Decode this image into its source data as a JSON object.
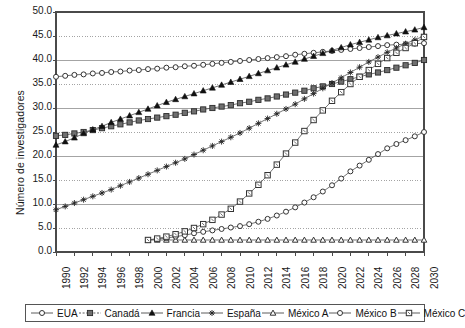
{
  "axes": {
    "ylabel": "Número de investigadores",
    "yticks": [
      "0.0",
      "5.0",
      "10.0",
      "15.0",
      "20.0",
      "25.0",
      "30.0",
      "35.0",
      "40.0",
      "45.0",
      "50.0"
    ],
    "ylim": [
      0,
      50
    ],
    "xticks": [
      "1990",
      "1992",
      "1994",
      "1996",
      "1998",
      "2000",
      "2002",
      "2004",
      "2006",
      "2008",
      "2010",
      "2012",
      "2014",
      "2016",
      "2018",
      "2020",
      "2022",
      "2024",
      "2026",
      "2028",
      "2030"
    ],
    "xlim": [
      1990,
      2030
    ]
  },
  "legend": {
    "items": [
      {
        "label": "EUA",
        "marker": "circle-open",
        "color": "#333333"
      },
      {
        "label": "Canadá",
        "marker": "square-filled",
        "color": "#555555"
      },
      {
        "label": "Francia",
        "marker": "triangle-filled",
        "color": "#111111"
      },
      {
        "label": "España",
        "marker": "star-x",
        "color": "#222222"
      },
      {
        "label": "México A",
        "marker": "triangle-open",
        "color": "#333333"
      },
      {
        "label": "México B",
        "marker": "circle-open",
        "color": "#333333"
      },
      {
        "label": "México C",
        "marker": "square-open",
        "color": "#333333"
      }
    ]
  },
  "chart_data": {
    "type": "line",
    "title": "",
    "xlabel": "",
    "ylabel": "Número de investigadores",
    "xlim": [
      1990,
      2030
    ],
    "ylim": [
      0,
      50
    ],
    "grid": true,
    "legend_position": "bottom",
    "x": [
      1990,
      1991,
      1992,
      1993,
      1994,
      1995,
      1996,
      1997,
      1998,
      1999,
      2000,
      2001,
      2002,
      2003,
      2004,
      2005,
      2006,
      2007,
      2008,
      2009,
      2010,
      2011,
      2012,
      2013,
      2014,
      2015,
      2016,
      2017,
      2018,
      2019,
      2020,
      2021,
      2022,
      2023,
      2024,
      2025,
      2026,
      2027,
      2028,
      2029,
      2030
    ],
    "series": [
      {
        "name": "EUA",
        "marker": "circle-open",
        "values": [
          36.5,
          36.7,
          36.9,
          37.0,
          37.2,
          37.3,
          37.5,
          37.6,
          37.8,
          37.9,
          38.1,
          38.2,
          38.4,
          38.5,
          38.7,
          38.8,
          39.0,
          39.2,
          39.4,
          39.6,
          39.8,
          40.0,
          40.2,
          40.4,
          40.6,
          40.8,
          41.1,
          41.3,
          41.5,
          41.7,
          41.9,
          42.1,
          42.3,
          42.5,
          42.7,
          42.9,
          43.1,
          43.2,
          43.3,
          43.4,
          43.5
        ]
      },
      {
        "name": "Canadá",
        "marker": "square-filled",
        "values": [
          24.2,
          24.4,
          24.7,
          25.0,
          25.4,
          25.8,
          26.2,
          26.6,
          27.0,
          27.4,
          27.7,
          28.0,
          28.3,
          28.6,
          29.0,
          29.3,
          29.7,
          30.0,
          30.3,
          30.6,
          31.0,
          31.3,
          31.7,
          32.0,
          32.4,
          32.8,
          33.2,
          33.6,
          34.1,
          34.5,
          35.0,
          35.5,
          36.0,
          36.5,
          37.0,
          37.4,
          37.9,
          38.4,
          38.9,
          39.4,
          40.0
        ]
      },
      {
        "name": "Francia",
        "marker": "triangle-filled",
        "values": [
          22.3,
          23.0,
          23.8,
          24.7,
          25.5,
          26.2,
          27.0,
          27.7,
          28.4,
          29.1,
          29.8,
          30.5,
          31.2,
          31.8,
          32.4,
          33.0,
          33.6,
          34.2,
          34.8,
          35.4,
          36.0,
          36.6,
          37.2,
          37.8,
          38.4,
          39.0,
          39.6,
          40.2,
          40.8,
          41.4,
          42.0,
          42.6,
          43.2,
          43.7,
          44.2,
          44.7,
          45.1,
          45.5,
          45.9,
          46.3,
          46.8
        ]
      },
      {
        "name": "España",
        "marker": "star-x",
        "values": [
          8.8,
          9.5,
          10.2,
          10.9,
          11.6,
          12.3,
          13.0,
          13.8,
          14.6,
          15.4,
          16.2,
          17.0,
          17.8,
          18.6,
          19.4,
          20.3,
          21.2,
          22.1,
          23.0,
          23.9,
          24.8,
          25.8,
          26.8,
          27.8,
          28.8,
          29.8,
          30.8,
          31.9,
          33.0,
          34.1,
          35.2,
          36.3,
          37.4,
          38.5,
          39.6,
          40.6,
          41.6,
          42.5,
          43.4,
          44.2,
          45.0
        ]
      },
      {
        "name": "México A",
        "marker": "triangle-open",
        "values": [
          null,
          null,
          null,
          null,
          null,
          null,
          null,
          null,
          null,
          null,
          2.5,
          2.5,
          2.5,
          2.5,
          2.5,
          2.5,
          2.5,
          2.5,
          2.5,
          2.5,
          2.5,
          2.5,
          2.5,
          2.5,
          2.5,
          2.5,
          2.5,
          2.5,
          2.5,
          2.5,
          2.5,
          2.5,
          2.5,
          2.5,
          2.5,
          2.5,
          2.5,
          2.5,
          2.5,
          2.5,
          2.5
        ]
      },
      {
        "name": "México B",
        "marker": "circle-open",
        "values": [
          null,
          null,
          null,
          null,
          null,
          null,
          null,
          null,
          null,
          null,
          2.5,
          2.7,
          2.9,
          3.2,
          3.5,
          3.9,
          4.2,
          4.5,
          4.8,
          5.1,
          5.4,
          5.8,
          6.3,
          6.9,
          7.6,
          8.4,
          9.3,
          10.3,
          11.4,
          12.6,
          13.9,
          15.3,
          16.8,
          18.0,
          19.2,
          20.4,
          21.6,
          22.5,
          23.3,
          24.1,
          25.0
        ]
      },
      {
        "name": "México C",
        "marker": "square-open",
        "values": [
          null,
          null,
          null,
          null,
          null,
          null,
          null,
          null,
          null,
          null,
          2.5,
          2.8,
          3.2,
          3.7,
          4.3,
          5.0,
          5.8,
          6.7,
          7.8,
          9.0,
          10.5,
          12.2,
          14.0,
          16.0,
          18.2,
          20.5,
          22.8,
          25.2,
          27.5,
          29.5,
          31.5,
          33.3,
          35.0,
          36.5,
          37.9,
          39.2,
          40.4,
          41.5,
          42.5,
          43.5,
          44.8
        ]
      }
    ]
  }
}
